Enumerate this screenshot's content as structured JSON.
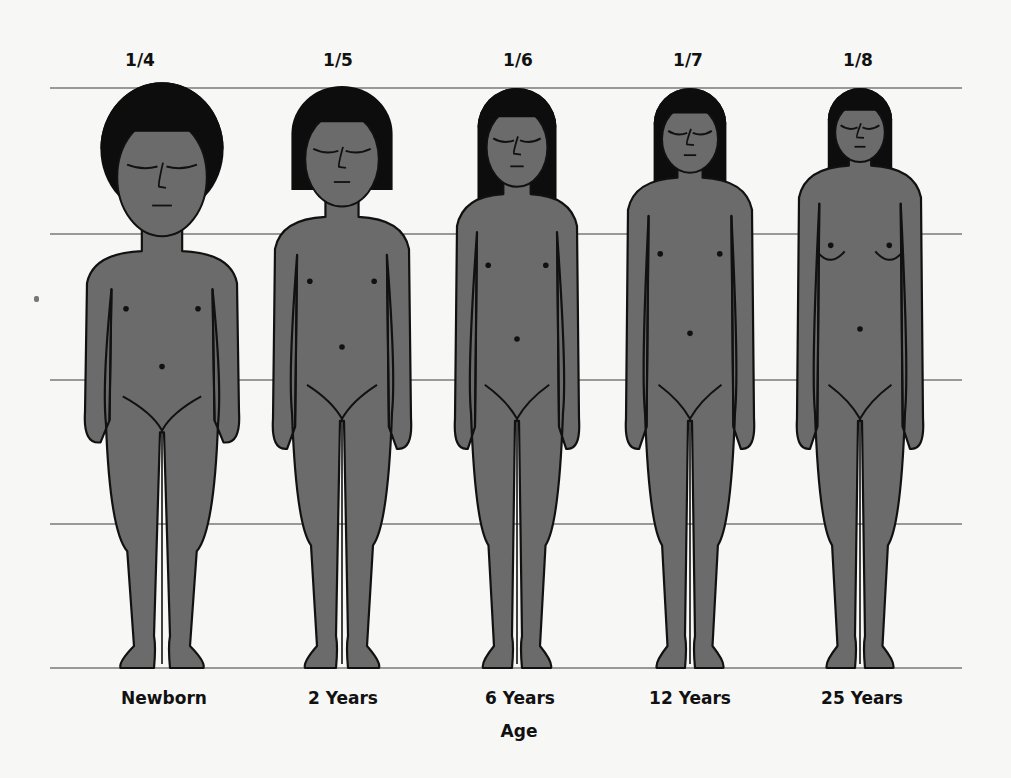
{
  "diagram": {
    "axis_label": "Age",
    "guide_lines_y": [
      88,
      234,
      380,
      524,
      668
    ],
    "guide_line_x_range": [
      50,
      962
    ],
    "colors": {
      "skin": "#6b6b6b",
      "hair": "#0d0d0d",
      "outline": "#111111",
      "guide_line": "#7a7a7a",
      "background": "#f7f7f5"
    },
    "figures": [
      {
        "id": "newborn",
        "ratio": "1/4",
        "age": "Newborn",
        "center_x": 162
      },
      {
        "id": "2-years",
        "ratio": "1/5",
        "age": "2 Years",
        "center_x": 342
      },
      {
        "id": "6-years",
        "ratio": "1/6",
        "age": "6 Years",
        "center_x": 517
      },
      {
        "id": "12-years",
        "ratio": "1/7",
        "age": "12 Years",
        "center_x": 690
      },
      {
        "id": "25-years",
        "ratio": "1/8",
        "age": "25 Years",
        "center_x": 860
      }
    ]
  }
}
